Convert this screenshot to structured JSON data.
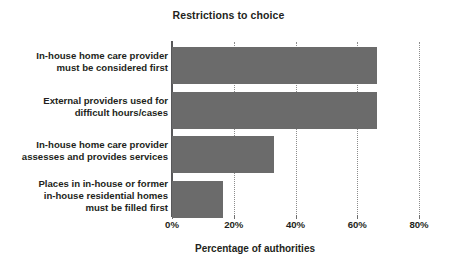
{
  "chart_data": {
    "type": "bar",
    "orientation": "horizontal",
    "title": "Restrictions to choice",
    "xlabel": "Percentage of authorities",
    "ylabel": "",
    "xlim": [
      0,
      80
    ],
    "xticks": [
      0,
      20,
      40,
      60,
      80
    ],
    "xtick_labels": [
      "0%",
      "20%",
      "40%",
      "60%",
      "80%"
    ],
    "grid": "vertical-dotted",
    "legend": "none",
    "bar_color": "#6b6b6b",
    "categories": [
      "In-house home care provider must be considered first",
      "External providers used for difficult hours/cases",
      "In-house home care provider assesses and provides services",
      "Places in in-house or former in-house residential homes must be filled first"
    ],
    "category_lines": [
      [
        "In-house home care provider",
        "must be considered first"
      ],
      [
        "External providers used for",
        "difficult hours/cases"
      ],
      [
        "In-house home care provider",
        "assesses and provides services"
      ],
      [
        "Places in in-house or former",
        "in-house residential homes",
        "must be filled first"
      ]
    ],
    "values": [
      66.5,
      66.5,
      33.0,
      16.5
    ]
  }
}
